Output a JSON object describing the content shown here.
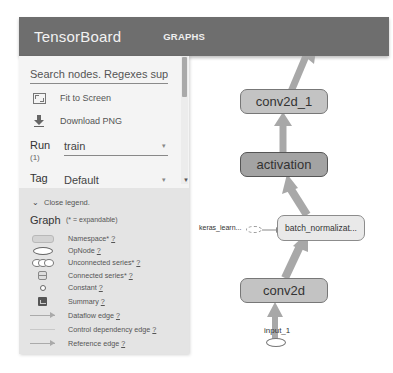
{
  "header": {
    "title": "TensorBoard",
    "tabs": [
      {
        "label": "GRAPHS",
        "active": true
      }
    ]
  },
  "sidebar": {
    "search_placeholder": "Search nodes. Regexes suppor...",
    "actions": [
      {
        "label": "Fit to Screen",
        "icon": "fit-to-screen-icon"
      },
      {
        "label": "Download PNG",
        "icon": "download-icon"
      }
    ],
    "run": {
      "label": "Run",
      "count": "(1)",
      "value": "train"
    },
    "tag": {
      "label": "Tag",
      "value": "Default"
    }
  },
  "legend": {
    "toggle_label": "Close legend.",
    "title": "Graph",
    "note": "(* = expandable)",
    "items": [
      {
        "symbol": "namespace",
        "label": "Namespace*",
        "help": "?"
      },
      {
        "symbol": "opnode",
        "label": "OpNode",
        "help": "?"
      },
      {
        "symbol": "unconnected-series",
        "label": "Unconnected series*",
        "help": "?"
      },
      {
        "symbol": "connected-series",
        "label": "Connected series*",
        "help": "?"
      },
      {
        "symbol": "constant",
        "label": "Constant",
        "help": "?"
      },
      {
        "symbol": "summary",
        "label": "Summary",
        "help": "?"
      },
      {
        "symbol": "dataflow-edge",
        "label": "Dataflow edge",
        "help": "?"
      },
      {
        "symbol": "control-dependency-edge",
        "label": "Control dependency edge",
        "help": "?"
      },
      {
        "symbol": "reference-edge",
        "label": "Reference edge",
        "help": "?"
      }
    ]
  },
  "graph": {
    "nodes": [
      {
        "id": "conv2d_1",
        "label": "conv2d_1"
      },
      {
        "id": "activation",
        "label": "activation"
      },
      {
        "id": "batch_normalization",
        "label": "batch_normalizat..."
      },
      {
        "id": "conv2d",
        "label": "conv2d"
      },
      {
        "id": "input_1",
        "label": "input_1"
      }
    ],
    "aux_input": {
      "label": "keras_learn..."
    }
  },
  "colors": {
    "header_bg": "#6e6e6e",
    "sidebar_bg": "#f4f4f4",
    "legend_bg": "#e4e4e4",
    "edge": "#a8a8a8"
  }
}
